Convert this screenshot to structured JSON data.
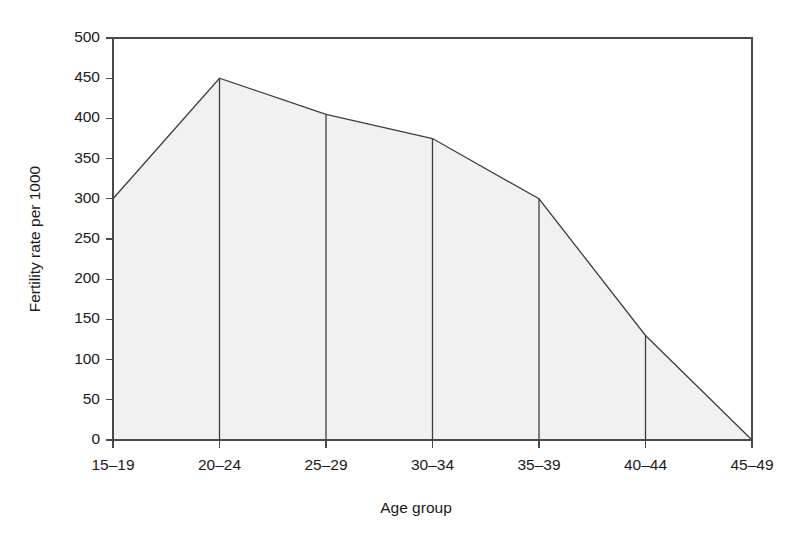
{
  "chart_data": {
    "type": "area",
    "title": "",
    "subtitle": "",
    "xlabel": "Age group",
    "ylabel": "Fertility rate per 1000",
    "categories": [
      "15–19",
      "20–24",
      "25–29",
      "30–34",
      "35–39",
      "40–44",
      "45–49"
    ],
    "values": [
      300,
      450,
      405,
      375,
      300,
      130,
      0
    ],
    "series": [
      {
        "name": "Fertility rate",
        "values": [
          300,
          450,
          405,
          375,
          300,
          130,
          0
        ]
      }
    ],
    "ylim": [
      0,
      500
    ],
    "ytick_values": [
      0,
      50,
      100,
      150,
      200,
      250,
      300,
      350,
      400,
      450,
      500
    ],
    "ytick_labels": [
      "0",
      "50",
      "100",
      "150",
      "200",
      "250",
      "300",
      "350",
      "400",
      "450",
      "500"
    ],
    "xtick_labels": [
      "15–19",
      "20–24",
      "25–29",
      "30–34",
      "35–39",
      "40–44",
      "45–49"
    ],
    "grid": false,
    "legend": false,
    "legend_position": "none",
    "annotations": [],
    "colors": {
      "area_fill": "#f1f1f1",
      "line": "#3f3f3f",
      "axis": "#4a4a4a",
      "text": "#1a1a1a",
      "background": "#ffffff"
    }
  }
}
